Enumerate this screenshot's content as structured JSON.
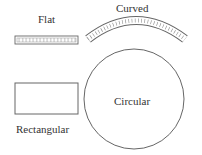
{
  "diagram": {
    "shapes": [
      {
        "id": "flat",
        "label": "Flat",
        "kind": "flat-strip"
      },
      {
        "id": "curved",
        "label": "Curved",
        "kind": "curved-strip"
      },
      {
        "id": "rectangular",
        "label": "Rectangular",
        "kind": "rectangle"
      },
      {
        "id": "circular",
        "label": "Circular",
        "kind": "circle"
      }
    ],
    "colors": {
      "stroke": "#555555",
      "text": "#333333",
      "background": "#ffffff"
    }
  }
}
